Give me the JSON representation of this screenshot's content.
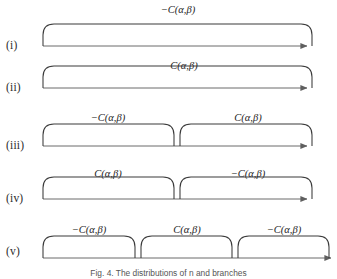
{
  "figure": {
    "caption": "Fig. 4. The distributions of n and branches",
    "line_color": "#6a6a6a",
    "curve_color": "#3a3a3a",
    "text_color": "#1d1d1d",
    "background": "#ffffff",
    "width": 337,
    "height": 279
  },
  "rows": [
    {
      "id": "i",
      "label": "(i)",
      "axis_y": 46,
      "segments": [
        {
          "label": "−C(α,β)",
          "x_start": 43,
          "x_end": 312,
          "label_x": 178,
          "label_y": 4
        }
      ]
    },
    {
      "id": "ii",
      "label": "(ii)",
      "axis_y": 88,
      "segments": [
        {
          "label": "C(α,β)",
          "x_start": 43,
          "x_end": 312,
          "label_x": 184,
          "label_y": 60
        }
      ]
    },
    {
      "id": "iii",
      "label": "(iii)",
      "axis_y": 146,
      "segments": [
        {
          "label": "−C(α,β)",
          "x_start": 43,
          "x_end": 174,
          "label_x": 108,
          "label_y": 112
        },
        {
          "label": "C(α,β)",
          "x_start": 180,
          "x_end": 312,
          "label_x": 248,
          "label_y": 112
        }
      ]
    },
    {
      "id": "iv",
      "label": "(iv)",
      "axis_y": 199,
      "segments": [
        {
          "label": "C(α,β)",
          "x_start": 43,
          "x_end": 174,
          "label_x": 108,
          "label_y": 168
        },
        {
          "label": "−C(α,β)",
          "x_start": 180,
          "x_end": 312,
          "label_x": 248,
          "label_y": 168
        }
      ]
    },
    {
      "id": "v",
      "label": "(v)",
      "axis_y": 258,
      "segments": [
        {
          "label": "−C(α,β)",
          "x_start": 43,
          "x_end": 135,
          "label_x": 89,
          "label_y": 224
        },
        {
          "label": "C(α,β)",
          "x_start": 141,
          "x_end": 232,
          "label_x": 187,
          "label_y": 224
        },
        {
          "label": "−C(α,β)",
          "x_start": 238,
          "x_end": 329,
          "label_x": 284,
          "label_y": 224
        }
      ]
    }
  ],
  "geometry": {
    "arrow_x_start": 43,
    "arrow_x_end": 312,
    "arch_height": 22,
    "corner_radius": 11,
    "label_row_x": 6
  },
  "caption_position": {
    "y": 268
  }
}
